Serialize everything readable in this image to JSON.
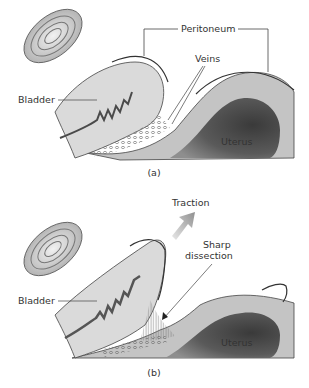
{
  "panel_a": {
    "labels": {
      "peritoneum": "Peritoneum",
      "veins": "Veins",
      "bladder": "Bladder",
      "uterus": "Uterus"
    },
    "caption": "(a)"
  },
  "panel_b": {
    "labels": {
      "traction": "Traction",
      "sharp": "Sharp",
      "dissection": "dissection",
      "bladder": "Bladder",
      "uterus": "Uterus"
    },
    "caption": "(b)"
  },
  "colors": {
    "tissue_light": "#d9d9d9",
    "tissue_mid": "#bdbdbd",
    "uterus_dark": "#5a5a5a",
    "vessel": "#4a4a4a",
    "outline": "#333333",
    "arrow": "#a0a0a0"
  }
}
